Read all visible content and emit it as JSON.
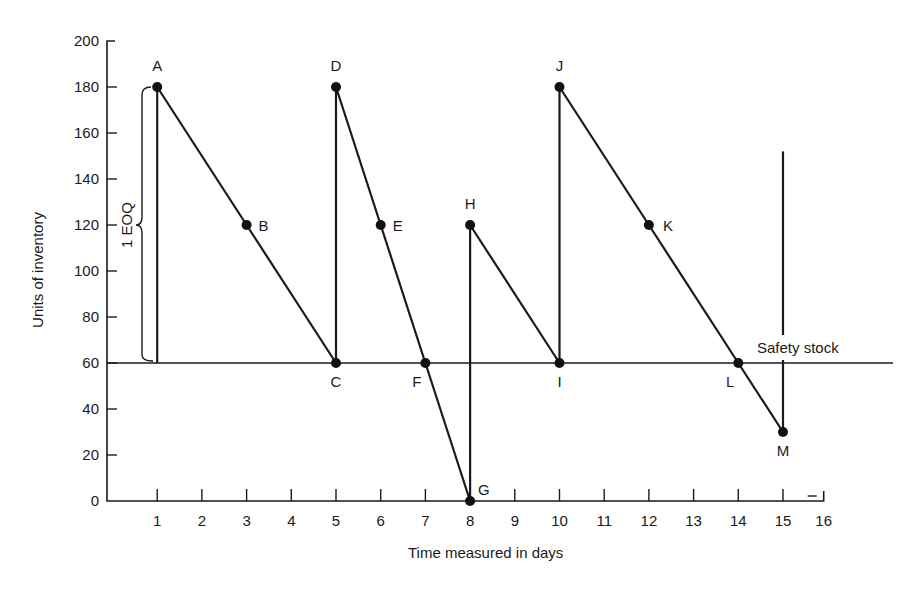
{
  "chart_data": {
    "type": "line",
    "title": "",
    "xlabel": "Time measured in days",
    "ylabel": "Units of inventory",
    "xlim": [
      0,
      16
    ],
    "ylim": [
      0,
      200
    ],
    "xticks": [
      1,
      2,
      3,
      4,
      5,
      6,
      7,
      8,
      9,
      10,
      11,
      12,
      13,
      14,
      15,
      16
    ],
    "yticks": [
      0,
      20,
      40,
      60,
      80,
      100,
      120,
      140,
      160,
      180,
      200
    ],
    "grid": false,
    "legend": null,
    "series": [
      {
        "name": "Inventory level",
        "points": [
          {
            "x": 1,
            "y": 60,
            "label": ""
          },
          {
            "x": 1,
            "y": 180,
            "label": "A"
          },
          {
            "x": 3,
            "y": 120,
            "label": "B"
          },
          {
            "x": 5,
            "y": 60,
            "label": "C"
          },
          {
            "x": 5,
            "y": 180,
            "label": "D"
          },
          {
            "x": 6,
            "y": 120,
            "label": "E"
          },
          {
            "x": 7,
            "y": 60,
            "label": "F"
          },
          {
            "x": 8,
            "y": 0,
            "label": "G"
          },
          {
            "x": 8,
            "y": 120,
            "label": "H"
          },
          {
            "x": 10,
            "y": 60,
            "label": "I"
          },
          {
            "x": 10,
            "y": 180,
            "label": "J"
          },
          {
            "x": 12,
            "y": 120,
            "label": "K"
          },
          {
            "x": 14,
            "y": 60,
            "label": "L"
          },
          {
            "x": 15,
            "y": 30,
            "label": "M"
          },
          {
            "x": 15,
            "y": 152,
            "label": ""
          }
        ]
      }
    ],
    "labeled_points": [
      {
        "label": "A",
        "x": 1,
        "y": 180
      },
      {
        "label": "B",
        "x": 3,
        "y": 120
      },
      {
        "label": "C",
        "x": 5,
        "y": 60
      },
      {
        "label": "D",
        "x": 5,
        "y": 180
      },
      {
        "label": "E",
        "x": 6,
        "y": 120
      },
      {
        "label": "F",
        "x": 7,
        "y": 60
      },
      {
        "label": "G",
        "x": 8,
        "y": 0
      },
      {
        "label": "H",
        "x": 8,
        "y": 120
      },
      {
        "label": "I",
        "x": 10,
        "y": 60
      },
      {
        "label": "J",
        "x": 10,
        "y": 180
      },
      {
        "label": "K",
        "x": 12,
        "y": 120
      },
      {
        "label": "L",
        "x": 14,
        "y": 60
      },
      {
        "label": "M",
        "x": 15,
        "y": 30
      }
    ],
    "reference_lines": [
      {
        "type": "horizontal",
        "y": 60,
        "label": "Safety stock"
      }
    ],
    "annotations": [
      {
        "text": "1 EOQ",
        "type": "brace",
        "from_y": 60,
        "to_y": 180,
        "at_x": 1
      }
    ]
  }
}
